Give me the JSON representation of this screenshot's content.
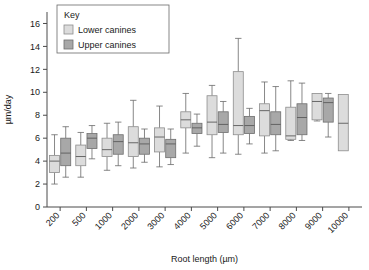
{
  "chart_data": {
    "type": "box",
    "title": "",
    "xlabel": "Root length (µm)",
    "ylabel": "µm/day",
    "ylim": [
      0,
      17
    ],
    "yticks": [
      0,
      2,
      4,
      6,
      8,
      10,
      12,
      14,
      16
    ],
    "grid": false,
    "categories": [
      "200",
      "500",
      "1000",
      "2000",
      "3000",
      "4000",
      "5000",
      "6000",
      "7000",
      "8000",
      "9000",
      "10000"
    ],
    "legend": {
      "title": "Key",
      "position": "top-left-inset",
      "entries": [
        {
          "name": "Lower canines",
          "color": "#dcdcdc"
        },
        {
          "name": "Upper canines",
          "color": "#a8a8a8"
        }
      ]
    },
    "series": [
      {
        "name": "Lower canines",
        "color": "#dcdcdc",
        "boxes": [
          {
            "category": "200",
            "whisker_low": 2.0,
            "q1": 3.0,
            "median": 4.0,
            "q3": 4.5,
            "whisker_high": 6.3
          },
          {
            "category": "500",
            "whisker_low": 2.6,
            "q1": 3.6,
            "median": 4.4,
            "q3": 5.4,
            "whisker_high": 6.5
          },
          {
            "category": "1000",
            "whisker_low": 3.2,
            "q1": 4.4,
            "median": 5.0,
            "q3": 6.0,
            "whisker_high": 7.3
          },
          {
            "category": "2000",
            "whisker_low": 3.4,
            "q1": 4.4,
            "median": 5.6,
            "q3": 7.0,
            "whisker_high": 9.3
          },
          {
            "category": "3000",
            "whisker_low": 3.5,
            "q1": 4.8,
            "median": 6.1,
            "q3": 6.9,
            "whisker_high": 8.8
          },
          {
            "category": "4000",
            "whisker_low": 4.7,
            "q1": 6.9,
            "median": 7.6,
            "q3": 8.3,
            "whisker_high": 9.9
          },
          {
            "category": "5000",
            "whisker_low": 4.3,
            "q1": 6.3,
            "median": 7.4,
            "q3": 9.7,
            "whisker_high": 10.6
          },
          {
            "category": "6000",
            "whisker_low": 4.6,
            "q1": 6.3,
            "median": 7.1,
            "q3": 11.8,
            "whisker_high": 14.7
          },
          {
            "category": "7000",
            "whisker_low": 4.7,
            "q1": 6.2,
            "median": 8.4,
            "q3": 9.0,
            "whisker_high": 10.9
          },
          {
            "category": "8000",
            "whisker_low": 5.8,
            "q1": 5.9,
            "median": 6.2,
            "q3": 8.7,
            "whisker_high": 11.0
          },
          {
            "category": "9000",
            "whisker_low": 7.5,
            "q1": 7.6,
            "median": 9.2,
            "q3": 9.9,
            "whisker_high": 9.9
          },
          {
            "category": "10000",
            "whisker_low": 4.9,
            "q1": 4.9,
            "median": 7.3,
            "q3": 9.8,
            "whisker_high": 9.8
          }
        ]
      },
      {
        "name": "Upper canines",
        "color": "#a8a8a8",
        "boxes": [
          {
            "category": "200",
            "whisker_low": 2.6,
            "q1": 3.6,
            "median": 4.7,
            "q3": 6.0,
            "whisker_high": 7.0
          },
          {
            "category": "500",
            "whisker_low": 4.2,
            "q1": 5.1,
            "median": 6.0,
            "q3": 6.4,
            "whisker_high": 7.1
          },
          {
            "category": "1000",
            "whisker_low": 3.6,
            "q1": 4.6,
            "median": 5.7,
            "q3": 6.3,
            "whisker_high": 7.4
          },
          {
            "category": "2000",
            "whisker_low": 3.9,
            "q1": 4.6,
            "median": 5.5,
            "q3": 6.0,
            "whisker_high": 6.8
          },
          {
            "category": "3000",
            "whisker_low": 3.7,
            "q1": 4.3,
            "median": 5.5,
            "q3": 5.9,
            "whisker_high": 6.8
          },
          {
            "category": "4000",
            "whisker_low": 5.3,
            "q1": 6.4,
            "median": 6.9,
            "q3": 7.3,
            "whisker_high": 8.1
          },
          {
            "category": "5000",
            "whisker_low": 4.7,
            "q1": 6.5,
            "median": 7.2,
            "q3": 8.3,
            "whisker_high": 9.2
          },
          {
            "category": "6000",
            "whisker_low": 5.5,
            "q1": 6.4,
            "median": 7.1,
            "q3": 7.9,
            "whisker_high": 8.6
          },
          {
            "category": "7000",
            "whisker_low": 4.9,
            "q1": 6.3,
            "median": 7.2,
            "q3": 8.3,
            "whisker_high": 10.5
          },
          {
            "category": "8000",
            "whisker_low": 5.8,
            "q1": 6.3,
            "median": 7.8,
            "q3": 9.0,
            "whisker_high": 10.8
          },
          {
            "category": "9000",
            "whisker_low": 6.1,
            "q1": 7.4,
            "median": 9.1,
            "q3": 9.5,
            "whisker_high": 9.9
          }
        ]
      }
    ]
  }
}
